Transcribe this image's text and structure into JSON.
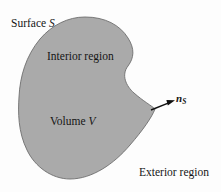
{
  "figure": {
    "background_color": "#fdfdfd",
    "width": 221,
    "height": 192
  },
  "shape": {
    "name": "closed-surface-blob",
    "fill_color": "#aaaaaa",
    "stroke_color": "#6e6e6e",
    "stroke_width": 0.9,
    "path": "M 85,17 C 105,17 120,25 128,38 C 135,49 134,58 128,66 C 121,75 126,86 134,93 C 143,101 152,106 155,109 C 152,117 143,130 130,145 C 114,164 92,179 70,179 C 52,179 35,167 27,150 C 18,132 18,112 19,97 C 20,76 26,56 40,39 C 52,25 68,17 85,17 Z"
  },
  "arrow": {
    "name": "outward-normal-arrow",
    "color": "#101010",
    "x1": 151,
    "y1": 110,
    "x2": 173,
    "y2": 101,
    "head_length": 7,
    "head_width": 5
  },
  "labels": {
    "surface": {
      "text_main": "Surface ",
      "symbol": "S"
    },
    "interior": {
      "text": "Interior region"
    },
    "volume": {
      "text_main": "Volume ",
      "symbol": "V"
    },
    "exterior": {
      "text": "Exterior region"
    },
    "normal": {
      "symbol": "n",
      "subscript": "S"
    }
  }
}
